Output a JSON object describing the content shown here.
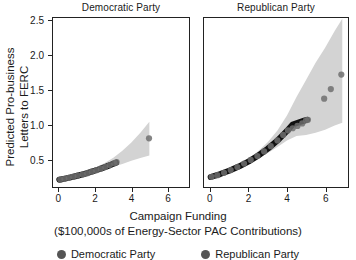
{
  "chart_data": {
    "type": "scatter",
    "title": "",
    "xlabel": "Campaign Funding ($100,000s of Energy-Sector PAC Contributions)",
    "xlabel_line1": "Campaign Funding",
    "xlabel_line2": "($100,000s of Energy-Sector PAC Contributions)",
    "ylabel": "Predicted Pro-business Letters to FERC",
    "ylabel_line1": "Predicted Pro-business",
    "ylabel_line2": "Letters to FERC",
    "xlim": [
      -0.35,
      7.2
    ],
    "ylim": [
      0.1,
      2.55
    ],
    "xticks": [
      0,
      2,
      4,
      6
    ],
    "xtick_labels": [
      "0",
      "2",
      "4",
      "6"
    ],
    "yticks": [
      0.5,
      1.0,
      1.5,
      2.0,
      2.5
    ],
    "ytick_labels": [
      "0.5",
      "1.0",
      "1.5",
      "2.0",
      "2.5"
    ],
    "grid": false,
    "legend_position": "bottom",
    "facet_variable": "Party",
    "colors": {
      "fit_line": "#111111",
      "ribbon": "#d3d3d3",
      "point": "#6e6e6e",
      "panel_border": "#222222",
      "text": "#1a1a1a",
      "background": "#ffffff"
    },
    "panels": [
      {
        "name": "Democratic Party",
        "facet_label": "Democratic Party",
        "x_range": [
          -0.35,
          7.2
        ],
        "fit": {
          "x": [
            0.0,
            0.25,
            0.5,
            0.75,
            1.0,
            1.25,
            1.5,
            1.75,
            2.0,
            2.25,
            2.5,
            2.75,
            3.0,
            3.15
          ],
          "y": [
            0.205,
            0.218,
            0.232,
            0.247,
            0.263,
            0.28,
            0.298,
            0.318,
            0.339,
            0.361,
            0.385,
            0.41,
            0.437,
            0.452
          ]
        },
        "ribbon": {
          "x": [
            0.0,
            0.5,
            1.0,
            1.5,
            2.0,
            2.5,
            3.0,
            3.5,
            4.0,
            4.5,
            5.0
          ],
          "lower": [
            0.19,
            0.215,
            0.245,
            0.278,
            0.315,
            0.352,
            0.392,
            0.435,
            0.48,
            0.52,
            0.555
          ],
          "upper": [
            0.22,
            0.252,
            0.288,
            0.33,
            0.382,
            0.445,
            0.525,
            0.625,
            0.745,
            0.885,
            1.045
          ]
        },
        "points": [
          {
            "x": 0.05,
            "y": 0.207
          },
          {
            "x": 0.28,
            "y": 0.219
          },
          {
            "x": 0.52,
            "y": 0.233
          },
          {
            "x": 0.78,
            "y": 0.249
          },
          {
            "x": 1.02,
            "y": 0.265
          },
          {
            "x": 1.3,
            "y": 0.283
          },
          {
            "x": 1.55,
            "y": 0.301
          },
          {
            "x": 1.8,
            "y": 0.322
          },
          {
            "x": 2.05,
            "y": 0.344
          },
          {
            "x": 2.3,
            "y": 0.366
          },
          {
            "x": 2.55,
            "y": 0.391
          },
          {
            "x": 2.8,
            "y": 0.418
          },
          {
            "x": 3.05,
            "y": 0.446
          },
          {
            "x": 3.18,
            "y": 0.462
          },
          {
            "x": 4.98,
            "y": 0.805
          }
        ]
      },
      {
        "name": "Republican Party",
        "facet_label": "Republican Party",
        "x_range": [
          -0.35,
          7.2
        ],
        "fit": {
          "x": [
            0.0,
            0.5,
            1.0,
            1.5,
            2.0,
            2.5,
            3.0,
            3.5,
            4.0,
            4.3,
            4.6,
            4.9,
            5.05
          ],
          "y": [
            0.245,
            0.288,
            0.34,
            0.4,
            0.472,
            0.556,
            0.656,
            0.773,
            0.912,
            1.006,
            1.035,
            1.062,
            1.075
          ]
        },
        "ribbon": {
          "x": [
            0.0,
            0.5,
            1.0,
            1.5,
            2.0,
            2.5,
            3.0,
            3.5,
            4.0,
            4.5,
            5.0,
            5.5,
            6.0,
            6.5,
            6.9
          ],
          "lower": [
            0.225,
            0.268,
            0.318,
            0.375,
            0.44,
            0.512,
            0.592,
            0.68,
            0.775,
            0.84,
            0.855,
            0.885,
            0.93,
            0.99,
            1.03
          ],
          "upper": [
            0.268,
            0.312,
            0.368,
            0.435,
            0.518,
            0.622,
            0.752,
            0.92,
            1.135,
            1.405,
            1.65,
            1.9,
            2.12,
            2.36,
            2.54
          ]
        },
        "points": [
          {
            "x": 0.05,
            "y": 0.247
          },
          {
            "x": 0.35,
            "y": 0.272
          },
          {
            "x": 0.7,
            "y": 0.305
          },
          {
            "x": 1.05,
            "y": 0.345
          },
          {
            "x": 1.4,
            "y": 0.39
          },
          {
            "x": 1.75,
            "y": 0.44
          },
          {
            "x": 2.1,
            "y": 0.492
          },
          {
            "x": 2.45,
            "y": 0.548
          },
          {
            "x": 2.8,
            "y": 0.616
          },
          {
            "x": 3.15,
            "y": 0.692
          },
          {
            "x": 3.5,
            "y": 0.775
          },
          {
            "x": 3.8,
            "y": 0.855
          },
          {
            "x": 4.05,
            "y": 0.92
          },
          {
            "x": 4.3,
            "y": 0.952
          },
          {
            "x": 4.55,
            "y": 0.985
          },
          {
            "x": 4.8,
            "y": 1.022
          },
          {
            "x": 5.0,
            "y": 1.068
          },
          {
            "x": 5.1,
            "y": 1.075
          },
          {
            "x": 5.95,
            "y": 1.38
          },
          {
            "x": 6.3,
            "y": 1.52
          },
          {
            "x": 6.85,
            "y": 1.73
          }
        ]
      }
    ],
    "legend_entries": [
      {
        "label": "Democratic Party"
      },
      {
        "label": "Republican Party"
      }
    ]
  }
}
